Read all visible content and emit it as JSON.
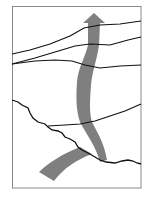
{
  "diagram": {
    "type": "schematic-flow",
    "colors": {
      "background": "#ffffff",
      "frame": "#8a8a8a",
      "lines": "#111111",
      "arrow": "#7f7f7f"
    },
    "frame": {
      "x": 12,
      "y": 6,
      "width": 129,
      "height": 182
    },
    "boundary_lines": [
      {
        "id": "line-1",
        "points": "12,54 30,50 50,44 70,36 84,28 100,25 120,24 141,21"
      },
      {
        "id": "line-2",
        "points": "12,64 35,58 55,52 75,46 90,44 110,45 128,40 141,37"
      },
      {
        "id": "line-3",
        "points": "12,64 35,61 55,60 72,61 85,65 100,68 120,66 141,65"
      },
      {
        "id": "line-4",
        "points": "12,100 18,102 22,105 28,108 30,113 33,118 38,122 45,124 48,127 52,130 58,131 62,133 65,137 70,139 75,142 78,147 82,150 88,153 95,157 100,160 106,162 115,163 122,161 128,160 133,161 137,163 141,164"
      },
      {
        "id": "line-5",
        "points": "48,126 65,125 80,124 95,121 110,116 125,111 141,104"
      }
    ],
    "arrows": [
      {
        "id": "main-arrow",
        "direction": "up"
      },
      {
        "id": "inflow-band",
        "direction": "up-right"
      }
    ]
  }
}
